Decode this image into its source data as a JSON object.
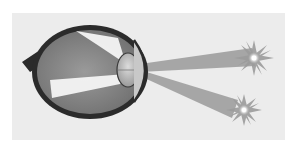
{
  "figure": {
    "colors": {
      "background": "#ffffff",
      "panel": "#ececec",
      "sclera": "#2b2b2b",
      "vitreous": "#8c8c8c",
      "vitreous_dark": "#6f6f6f",
      "lens": "#b5b5b5",
      "ray_inside": "#f4f4f4",
      "ray_outside": "#9a9a9a",
      "star": "#a8a8a8",
      "star_core": "#ffffff"
    },
    "elements": [
      {
        "name": "optic-nerve"
      },
      {
        "name": "eyeball"
      },
      {
        "name": "lens"
      },
      {
        "name": "cornea"
      },
      {
        "name": "light-ray-upper-source"
      },
      {
        "name": "light-ray-lower-source"
      },
      {
        "name": "light-source-upper"
      },
      {
        "name": "light-source-lower"
      }
    ]
  }
}
